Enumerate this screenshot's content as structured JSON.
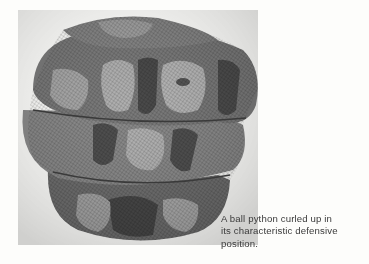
{
  "figure": {
    "image_alt": "Photograph of a ball python curled up into a tight ball",
    "colors": {
      "background": "#fdfdfb",
      "snake_dark": "#4a4a4a",
      "snake_mid": "#7d7d7d",
      "snake_light": "#b8b8b8",
      "caption_text": "#3a3a3a"
    },
    "caption": {
      "lines": [
        "A ball python curled up in",
        "its characteristic defensive",
        "position."
      ]
    }
  }
}
